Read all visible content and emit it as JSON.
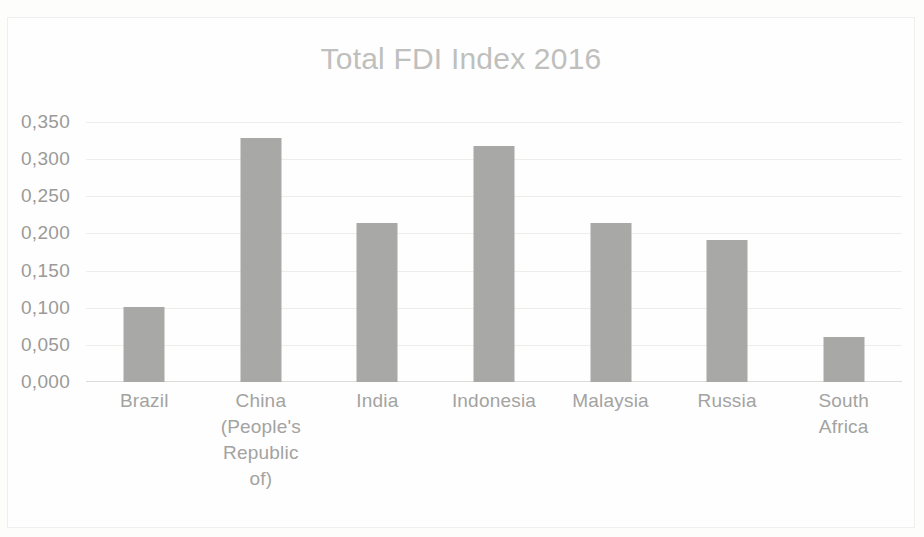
{
  "chart_data": {
    "type": "bar",
    "title": "Total FDI Index 2016",
    "xlabel": "",
    "ylabel": "",
    "categories": [
      "Brazil",
      "China (People's Republic of)",
      "India",
      "Indonesia",
      "Malaysia",
      "Russia",
      "South Africa"
    ],
    "category_lines": [
      [
        "Brazil"
      ],
      [
        "China",
        "(People's",
        "Republic",
        "of)"
      ],
      [
        "India"
      ],
      [
        "Indonesia"
      ],
      [
        "Malaysia"
      ],
      [
        "Russia"
      ],
      [
        "South",
        "Africa"
      ]
    ],
    "values": [
      0.101,
      0.328,
      0.214,
      0.318,
      0.214,
      0.191,
      0.06
    ],
    "ylim": [
      0.0,
      0.35
    ],
    "ytick_values": [
      0.35,
      0.3,
      0.25,
      0.2,
      0.15,
      0.1,
      0.05,
      0.0
    ],
    "ytick_labels": [
      "0,350",
      "0,300",
      "0,250",
      "0,200",
      "0,150",
      "0,100",
      "0,050",
      "0,000"
    ],
    "grid": true,
    "legend": false,
    "bar_color": "#a8a8a6",
    "title_color": "#bfbfbd",
    "tick_color": "#9a9a98",
    "gridline_color": "#ededeb",
    "background_color": "#fefefe"
  }
}
